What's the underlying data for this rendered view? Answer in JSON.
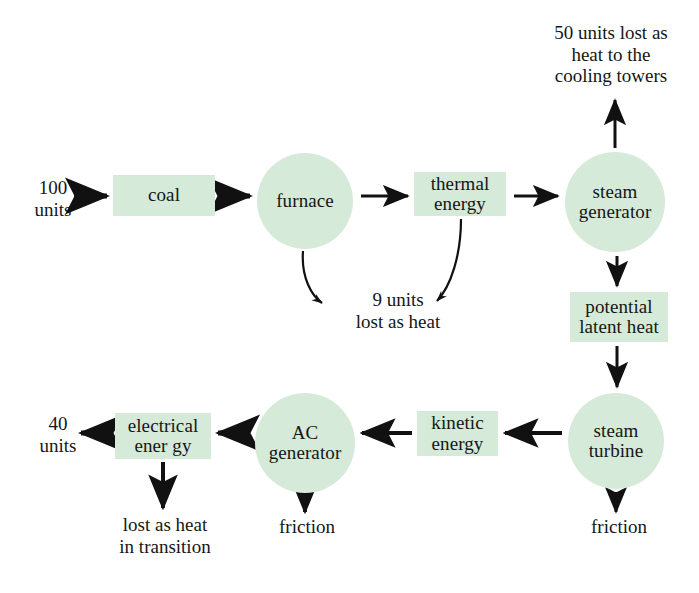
{
  "diagram": {
    "accent_fill": "#d5ead9",
    "text_color": "#161616",
    "arrow_color": "#111111",
    "nodes": [
      {
        "id": "coal",
        "label": "coal",
        "shape": "box",
        "x": 113,
        "y": 175,
        "w": 102,
        "h": 41
      },
      {
        "id": "furnace",
        "label": "furnace",
        "shape": "circle",
        "x": 257,
        "y": 153,
        "w": 96,
        "h": 96
      },
      {
        "id": "thermal-energy",
        "label": "thermal\nenergy",
        "shape": "box",
        "x": 414,
        "y": 172,
        "w": 92,
        "h": 44
      },
      {
        "id": "steam-generator",
        "label": "steam\ngenerator",
        "shape": "circle",
        "x": 565,
        "y": 152,
        "w": 100,
        "h": 100
      },
      {
        "id": "potential-latent-heat",
        "label": "potential\nlatent heat",
        "shape": "box",
        "x": 570,
        "y": 292,
        "w": 98,
        "h": 50
      },
      {
        "id": "steam-turbine",
        "label": "steam\nturbine",
        "shape": "circle",
        "x": 568,
        "y": 393,
        "w": 96,
        "h": 96
      },
      {
        "id": "kinetic-energy",
        "label": "kinetic\nenergy",
        "shape": "box",
        "x": 417,
        "y": 411,
        "w": 81,
        "h": 45
      },
      {
        "id": "ac-generator",
        "label": "AC\ngenerator",
        "shape": "circle",
        "x": 255,
        "y": 393,
        "w": 100,
        "h": 100
      },
      {
        "id": "electrical-energy",
        "label": "electrical\nener gy",
        "shape": "box",
        "x": 115,
        "y": 413,
        "w": 96,
        "h": 46
      }
    ],
    "labels": [
      {
        "id": "input-units",
        "text": "100\nunits",
        "x": 22,
        "y": 177,
        "w": 62
      },
      {
        "id": "cooling-tower-loss",
        "text": "50 units lost as\nheat to the\ncooling towers",
        "x": 525,
        "y": 22,
        "w": 172
      },
      {
        "id": "furnace-heat-loss",
        "text": "9 units\nlost as heat",
        "x": 328,
        "y": 289,
        "w": 140
      },
      {
        "id": "output-units",
        "text": "40\nunits",
        "x": 27,
        "y": 413,
        "w": 62
      },
      {
        "id": "transition-heat-loss",
        "text": "lost as heat\nin transition",
        "x": 100,
        "y": 514,
        "w": 130
      },
      {
        "id": "ac-generator-friction",
        "text": "friction",
        "x": 268,
        "y": 516,
        "w": 78
      },
      {
        "id": "steam-turbine-friction",
        "text": "friction",
        "x": 580,
        "y": 516,
        "w": 78
      }
    ],
    "edges": [
      {
        "id": "edge-input-to-coal",
        "from": "100 units",
        "to": "coal"
      },
      {
        "id": "edge-coal-to-furnace",
        "from": "coal",
        "to": "furnace"
      },
      {
        "id": "edge-furnace-to-thermal",
        "from": "furnace",
        "to": "thermal energy"
      },
      {
        "id": "edge-thermal-to-steam-generator",
        "from": "thermal energy",
        "to": "steam generator"
      },
      {
        "id": "edge-steam-generator-to-cooling",
        "from": "steam generator",
        "to": "50 units lost as heat to the cooling towers"
      },
      {
        "id": "edge-furnace-to-heat-loss",
        "from": "furnace",
        "to": "9 units lost as heat"
      },
      {
        "id": "edge-thermal-to-heat-loss",
        "from": "thermal energy",
        "to": "9 units lost as heat"
      },
      {
        "id": "edge-steam-generator-to-latent",
        "from": "steam generator",
        "to": "potential latent heat"
      },
      {
        "id": "edge-latent-to-turbine",
        "from": "potential latent heat",
        "to": "steam turbine"
      },
      {
        "id": "edge-turbine-to-kinetic",
        "from": "steam turbine",
        "to": "kinetic energy"
      },
      {
        "id": "edge-turbine-to-friction",
        "from": "steam turbine",
        "to": "friction"
      },
      {
        "id": "edge-kinetic-to-ac-generator",
        "from": "kinetic energy",
        "to": "AC generator"
      },
      {
        "id": "edge-ac-generator-to-electrical",
        "from": "AC generator",
        "to": "electrical energy"
      },
      {
        "id": "edge-ac-generator-to-friction",
        "from": "AC generator",
        "to": "friction"
      },
      {
        "id": "edge-electrical-to-output",
        "from": "electrical energy",
        "to": "40 units"
      },
      {
        "id": "edge-electrical-to-transition-loss",
        "from": "electrical energy",
        "to": "lost as heat in transition"
      }
    ]
  }
}
